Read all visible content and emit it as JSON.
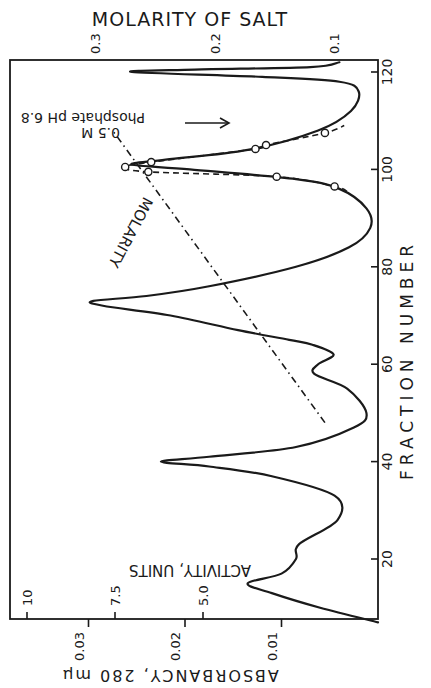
{
  "chart_data": {
    "type": "line",
    "orientation": "rotated-90-clockwise",
    "title": "",
    "xlabel": "FRACTION NUMBER",
    "ylabel": "ABSORBANCY, 280 mμ",
    "secondary_ylabel": "ACTIVITY, UNITS",
    "top_axis_label": "MOLARITY OF SALT",
    "x_ticks": [
      20,
      40,
      60,
      80,
      100,
      120
    ],
    "x_tick_labels": [
      "20",
      "40",
      "60",
      "80",
      "100",
      "120"
    ],
    "y_ticks": [
      0.01,
      0.02,
      0.03
    ],
    "y_tick_labels": [
      "0.01",
      "0.02",
      "0.03"
    ],
    "secondary_y_ticks": [
      5.0,
      7.5,
      10
    ],
    "secondary_y_tick_labels": [
      "5.0",
      "7.5",
      "10"
    ],
    "top_axis_ticks": [
      0.3,
      0.2,
      0.1
    ],
    "top_axis_tick_labels": [
      "0.3",
      "0.2",
      "0.1"
    ],
    "xlim": [
      7,
      122
    ],
    "ylim": [
      0,
      0.034
    ],
    "grid": false,
    "series": [
      {
        "name": "Absorbancy 280 mμ",
        "style": "solid",
        "x": [
          7,
          10,
          13,
          15,
          17,
          20,
          23,
          28,
          33,
          37,
          39,
          40,
          41,
          43,
          47,
          50,
          55,
          58,
          60,
          62,
          64,
          65,
          67,
          70,
          72,
          73,
          74,
          76,
          80,
          84,
          88,
          92,
          96,
          98,
          100,
          101,
          102,
          104,
          108,
          112,
          116,
          118,
          119,
          120,
          120.5,
          121,
          122
        ],
        "values": [
          0.0,
          0.006,
          0.011,
          0.0135,
          0.01,
          0.0085,
          0.0082,
          0.0042,
          0.0045,
          0.011,
          0.0175,
          0.0225,
          0.0175,
          0.0085,
          0.0025,
          0.0012,
          0.0032,
          0.0066,
          0.0062,
          0.0046,
          0.0068,
          0.0092,
          0.0145,
          0.0215,
          0.0285,
          0.0295,
          0.024,
          0.0175,
          0.0085,
          0.003,
          0.0008,
          0.0012,
          0.004,
          0.0085,
          0.0195,
          0.0255,
          0.022,
          0.0135,
          0.0062,
          0.0028,
          0.002,
          0.004,
          0.012,
          0.0255,
          0.019,
          0.007,
          0.004
        ]
      },
      {
        "name": "Activity units",
        "style": "dashed-with-circles",
        "x": [
          96.5,
          98.5,
          99.5,
          100.5,
          101.5,
          104.2,
          105,
          107.5
        ],
        "values": [
          0.0045,
          0.0105,
          0.0238,
          0.0262,
          0.0235,
          0.0127,
          0.0116,
          0.0055
        ]
      },
      {
        "name": "Molarity",
        "style": "dash-dot",
        "x": [
          48,
          108
        ],
        "values": [
          0.0055,
          0.0275
        ]
      }
    ],
    "annotations": [
      {
        "text": "MOLARITY",
        "near_fraction": 88
      },
      {
        "text": "0.5 M Phosphate pH 6.8",
        "at_fraction": 110,
        "arrow": true
      },
      {
        "text": "ACTIVITY, UNITS",
        "near_fraction": 20
      }
    ]
  },
  "labels": {
    "top_axis_title": "MOLARITY OF SALT",
    "x_axis_title": "FRACTION   NUMBER",
    "y_axis_title": "ABSORBANCY,  280 mμ",
    "activity_label": "ACTIVITY, UNITS",
    "molarity_line_label": "MOLARITY",
    "buffer_label_line1": "0.5 M",
    "buffer_label_line2": "Phosphate pH 6.8"
  }
}
